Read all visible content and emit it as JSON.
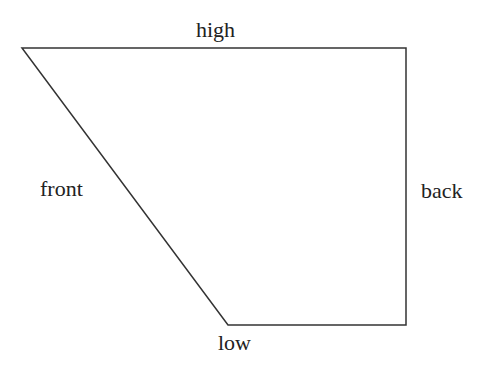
{
  "diagram": {
    "type": "trapezoid-vowel-chart",
    "stroke_color": "#333333",
    "vertices": [
      [
        22,
        48
      ],
      [
        406,
        48
      ],
      [
        406,
        325
      ],
      [
        228,
        325
      ]
    ],
    "labels": {
      "top": "high",
      "left": "front",
      "right": "back",
      "bottom": "low"
    }
  }
}
